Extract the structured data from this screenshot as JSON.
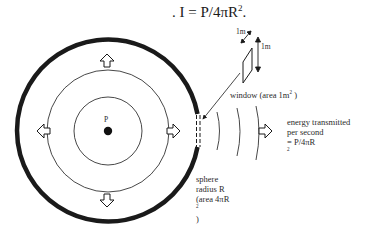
{
  "formula": {
    "text": ". I = P/4πR",
    "exponent": "2",
    "suffix": "."
  },
  "labels": {
    "source": "P",
    "dimension_diagonal": "1m",
    "dimension_vertical": "1m",
    "window": {
      "text": "window  (area  1m",
      "exponent": "2",
      "suffix": " )"
    },
    "energy": {
      "line1": "energy transmitted",
      "line2": "per second",
      "line3_prefix": "=  P/4πR",
      "line3_exponent": "2"
    },
    "sphere": {
      "line1": "sphere",
      "line2": "radius  R",
      "line3_prefix": "(area  4πR",
      "line3_exponent": "2",
      "line3_suffix": " )"
    }
  },
  "diagram": {
    "outer_sphere_radius_px": 91,
    "middle_circle_radius_px": 61,
    "inner_circle_radius_px": 34,
    "arrow_directions": [
      "up",
      "down",
      "left",
      "right"
    ],
    "wavefront_count": 3,
    "stroke_color": "#1a1a1a"
  }
}
